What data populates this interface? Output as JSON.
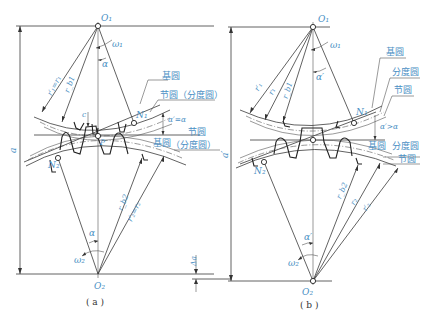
{
  "figure": {
    "panel_a": {
      "caption": "( a )",
      "labels": {
        "O1": "O₁",
        "O2": "O₂",
        "N1": "N₁",
        "N2": "N₂",
        "P": "P",
        "omega1": "ω₁",
        "omega2": "ω₂",
        "alpha_top": "α",
        "alpha_bottom": "α",
        "r1_pitch": "r′₁=r₁",
        "rb1": "r_b1",
        "rb2": "r_b2",
        "r2_pitch": "r′₂=r₂",
        "c": "c",
        "a": "a",
        "delta_a": "Δa",
        "pressure_angle": "α′=α",
        "base_circle_top": "基圆",
        "pitch_circle_top": "节圆（分度圆）",
        "pitch_circle_bottom": "节圆",
        "base_circle_bottom": "基圆",
        "ref_circle_bottom": "（分度圆）"
      }
    },
    "panel_b": {
      "caption": "( b )",
      "labels": {
        "O1": "O₁",
        "O2": "O₂",
        "N1": "N₁",
        "N2": "N₂",
        "omega1": "ω₁",
        "omega2": "ω₂",
        "alpha_top": "α′",
        "alpha_bottom": "α′",
        "r1_prime": "r′₁",
        "r1": "r₁",
        "rb1": "r_b1",
        "rb2": "r_b2",
        "r2": "r₂",
        "r2_prime": "r′₂",
        "a_prime": "a′",
        "pressure_angle": "α′>α",
        "base_circle_top": "基圆",
        "ref_circle_top": "分度圆",
        "pitch_circle_top": "节圆",
        "base_circle_bottom": "基圆",
        "ref_circle_bottom": "分度圆",
        "pitch_circle_bottom": "节圆"
      }
    }
  }
}
